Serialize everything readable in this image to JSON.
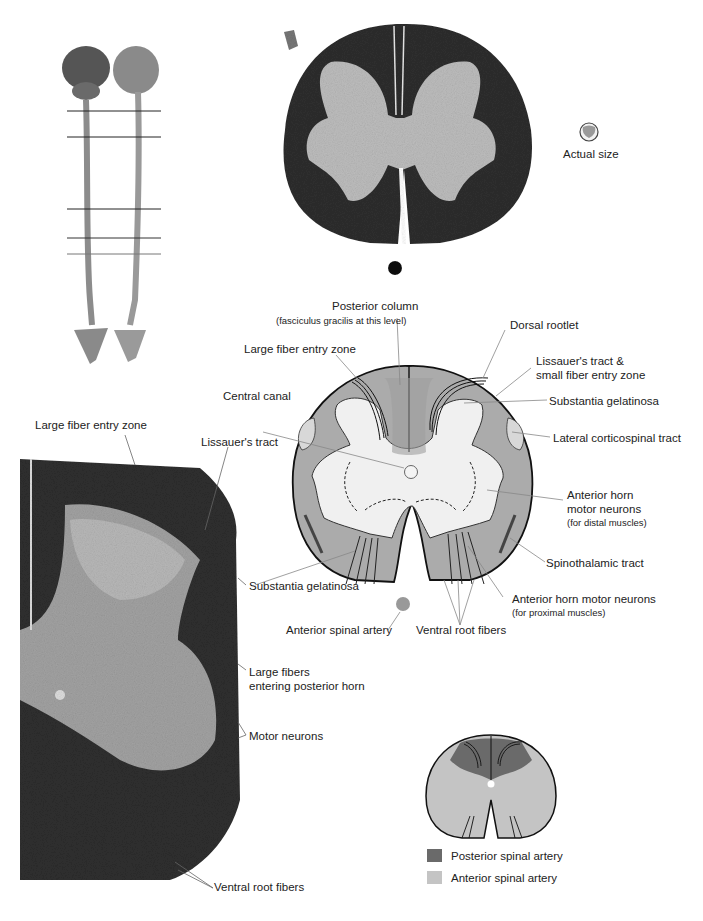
{
  "figure": {
    "actual_size_label": "Actual size",
    "spinal_cord_levels": {
      "count": 5,
      "line_y": [
        111,
        137,
        209,
        238,
        254
      ]
    },
    "colors": {
      "white_matter_stained": "#2a2a2a",
      "gray_matter_stained": "#b8b8b8",
      "diagram_white_matter": "#a9a9a9",
      "diagram_gray_matter": "#efefef",
      "posterior_spinal_artery": "#6a6a6a",
      "anterior_spinal_artery": "#c4c4c4",
      "leader_line": "#777777"
    }
  },
  "diagram_labels": {
    "posterior_column": "Posterior column",
    "posterior_column_sub": "(fasciculus gracilis at this level)",
    "dorsal_rootlet": "Dorsal rootlet",
    "large_fiber_entry_zone": "Large fiber entry zone",
    "lissauer_small_fiber_1": "Lissauer's tract &",
    "lissauer_small_fiber_2": "small fiber entry zone",
    "central_canal": "Central canal",
    "substantia_gelatinosa": "Substantia gelatinosa",
    "lateral_corticospinal": "Lateral corticospinal tract",
    "anterior_horn_distal_1": "Anterior horn",
    "anterior_horn_distal_2": "motor neurons",
    "anterior_horn_distal_sub": "(for distal muscles)",
    "spinothalamic": "Spinothalamic tract",
    "anterior_horn_proximal": "Anterior horn motor neurons",
    "anterior_horn_proximal_sub": "(for proximal muscles)",
    "anterior_spinal_artery": "Anterior spinal artery",
    "ventral_root_fibers": "Ventral root fibers"
  },
  "histology_labels": {
    "large_fiber_entry_zone": "Large fiber entry zone",
    "lissauer_tract": "Lissauer's tract",
    "substantia_gelatinosa": "Substantia gelatinosa",
    "large_fibers_1": "Large fibers",
    "large_fibers_2": "entering posterior horn",
    "motor_neurons": "Motor neurons",
    "ventral_root_fibers": "Ventral root fibers"
  },
  "legend": {
    "items": [
      {
        "label": "Posterior spinal artery",
        "color": "#6a6a6a"
      },
      {
        "label": "Anterior spinal artery",
        "color": "#c4c4c4"
      }
    ]
  }
}
